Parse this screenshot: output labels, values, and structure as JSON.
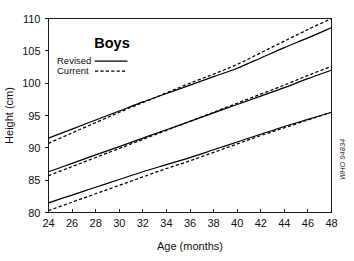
{
  "chart_data": {
    "type": "line",
    "title": "Boys",
    "xlabel": "Age (months)",
    "ylabel": "Height (cm)",
    "xlim": [
      24,
      48
    ],
    "ylim": [
      80,
      110
    ],
    "xticks": [
      24,
      26,
      28,
      30,
      32,
      34,
      36,
      38,
      40,
      42,
      44,
      46,
      48
    ],
    "yticks": [
      80,
      85,
      90,
      95,
      100,
      105,
      110
    ],
    "grid": false,
    "legend_position": "upper-left-inside",
    "legend": [
      {
        "name": "Revised",
        "style": "solid"
      },
      {
        "name": "Current",
        "style": "dashed"
      }
    ],
    "x": [
      24,
      26,
      28,
      30,
      32,
      34,
      36,
      38,
      40,
      42,
      44,
      46,
      48
    ],
    "series": [
      {
        "name": "Revised upper",
        "legend": "Revised",
        "style": "solid",
        "values": [
          91.5,
          92.9,
          94.3,
          95.7,
          97.1,
          98.4,
          99.7,
          101.0,
          102.3,
          103.9,
          105.5,
          107.0,
          108.6
        ]
      },
      {
        "name": "Current upper",
        "legend": "Current",
        "style": "dashed",
        "values": [
          90.7,
          92.3,
          93.9,
          95.5,
          97.0,
          98.5,
          100.0,
          101.4,
          102.9,
          104.7,
          106.5,
          108.3,
          110.0
        ]
      },
      {
        "name": "Revised median",
        "legend": "Revised",
        "style": "solid",
        "values": [
          86.3,
          87.6,
          88.9,
          90.2,
          91.5,
          92.8,
          94.1,
          95.4,
          96.7,
          98.0,
          99.3,
          100.7,
          102.0
        ]
      },
      {
        "name": "Current median",
        "legend": "Current",
        "style": "dashed",
        "values": [
          85.7,
          87.1,
          88.5,
          89.9,
          91.3,
          92.7,
          94.1,
          95.5,
          96.9,
          98.3,
          99.7,
          101.2,
          102.6
        ]
      },
      {
        "name": "Revised lower",
        "legend": "Revised",
        "style": "solid",
        "values": [
          81.5,
          82.7,
          83.9,
          85.1,
          86.3,
          87.4,
          88.5,
          89.7,
          90.9,
          92.1,
          93.3,
          94.4,
          95.5
        ]
      },
      {
        "name": "Current lower",
        "legend": "Current",
        "style": "dashed",
        "values": [
          80.3,
          81.6,
          82.9,
          84.2,
          85.5,
          86.8,
          88.0,
          89.3,
          90.6,
          91.9,
          93.1,
          94.3,
          95.5
        ]
      }
    ],
    "annotations": [
      {
        "name": "credit",
        "text": "WHO 94834",
        "position": "right-edge",
        "rotation": -90
      }
    ],
    "colors": {
      "axis": "#1a1a1a",
      "series": "#000000",
      "background": "#ffffff"
    }
  }
}
